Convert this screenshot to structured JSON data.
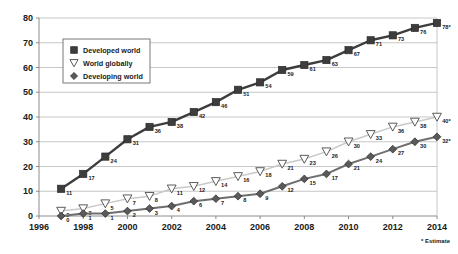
{
  "chart_data": {
    "type": "line",
    "title": "",
    "xlabel": "",
    "ylabel": "",
    "x": [
      1997,
      1998,
      1999,
      2000,
      2001,
      2002,
      2003,
      2004,
      2005,
      2006,
      2007,
      2008,
      2009,
      2010,
      2011,
      2012,
      2013,
      2014
    ],
    "xlim": [
      1996,
      2014
    ],
    "ylim": [
      0,
      80
    ],
    "xticks": [
      "1996",
      "1998",
      "2000",
      "2002",
      "2004",
      "2006",
      "2008",
      "2010",
      "2012",
      "2014"
    ],
    "xtick_values": [
      1996,
      1998,
      2000,
      2002,
      2004,
      2006,
      2008,
      2010,
      2012,
      2014
    ],
    "yticks": [
      "0",
      "10",
      "20",
      "30",
      "40",
      "50",
      "60",
      "70",
      "80"
    ],
    "ytick_values": [
      0,
      10,
      20,
      30,
      40,
      50,
      60,
      70,
      80
    ],
    "grid": true,
    "grid_axis": "y",
    "legend_position": "upper-left",
    "annotation": "* Estimate",
    "series": [
      {
        "name": "Developed world",
        "marker": "filled-square",
        "color": "#3d3d3d",
        "line_color": "#3d3d3d",
        "values": [
          11,
          17,
          24,
          31,
          36,
          38,
          42,
          46,
          51,
          54,
          59,
          61,
          63,
          67,
          71,
          73,
          76,
          78
        ],
        "labels": [
          "11",
          "17",
          "24",
          "31",
          "36",
          "38",
          "42",
          "46",
          "51",
          "54",
          "59",
          "61",
          "63",
          "67",
          "71",
          "73",
          "76",
          "78*"
        ]
      },
      {
        "name": "World globally",
        "marker": "open-triangle-down",
        "color": "#ffffff",
        "line_color": "#c9c9c9",
        "values": [
          2,
          3,
          5,
          7,
          8,
          11,
          12,
          14,
          16,
          18,
          21,
          23,
          26,
          30,
          33,
          36,
          38,
          40
        ],
        "labels": [
          "2",
          "3",
          "5",
          "7",
          "8",
          "11",
          "12",
          "14",
          "16",
          "18",
          "21",
          "23",
          "26",
          "30",
          "33",
          "36",
          "38",
          "40*"
        ]
      },
      {
        "name": "Developing world",
        "marker": "filled-diamond",
        "color": "#5a5a5a",
        "line_color": "#6e6e6e",
        "values": [
          0,
          1,
          1,
          2,
          3,
          4,
          6,
          7,
          8,
          9,
          12,
          15,
          17,
          21,
          24,
          27,
          30,
          32
        ],
        "labels": [
          "0",
          "1",
          "1",
          "2",
          "3",
          "4",
          "6",
          "7",
          "8",
          "9",
          "12",
          "15",
          "17",
          "21",
          "24",
          "27",
          "30",
          "32*"
        ]
      }
    ]
  },
  "legend": {
    "items": [
      {
        "label": "Developed world",
        "marker": "filled-square"
      },
      {
        "label": "World globally",
        "marker": "open-triangle-down"
      },
      {
        "label": "Developing world",
        "marker": "filled-diamond"
      }
    ]
  },
  "footnote": {
    "text": "* Estimate"
  },
  "colors": {
    "developed": "#3d3d3d",
    "world": "#c9c9c9",
    "developing": "#6e6e6e",
    "grid": "#b9b9b9",
    "axis": "#8c8c8c",
    "text": "#1a1a1a",
    "background": "#ffffff"
  }
}
